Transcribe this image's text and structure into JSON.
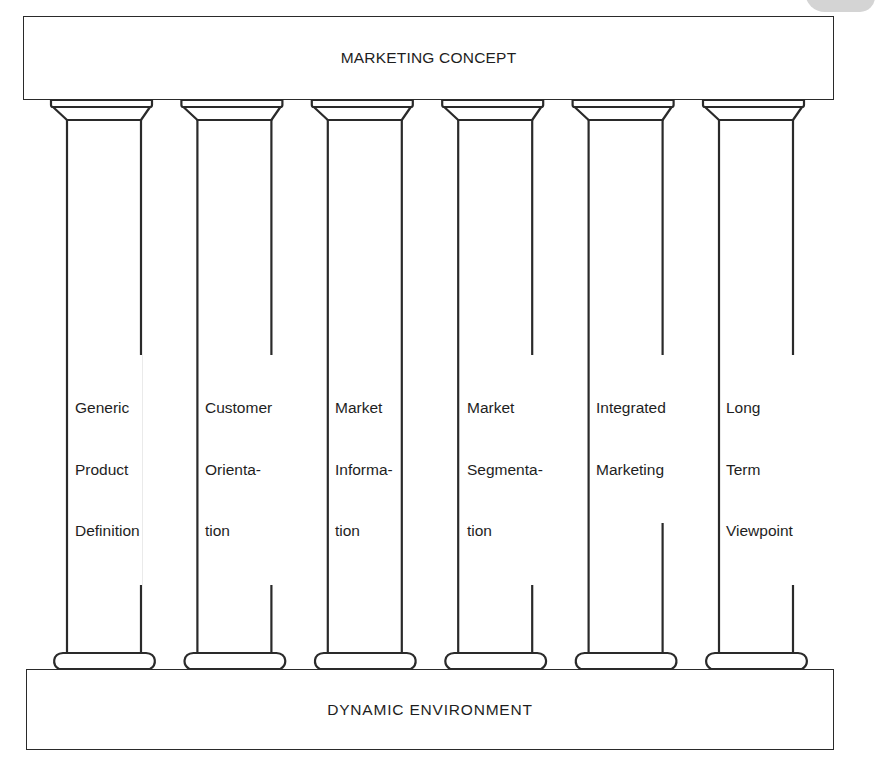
{
  "diagram": {
    "title_top": "MARKETING CONCEPT",
    "title_bottom": "DYNAMIC ENVIRONMENT",
    "stroke_color": "#2a2a2a",
    "background_color": "#ffffff",
    "pillars": [
      {
        "label_lines": [
          "Generic",
          "Product",
          "Definition"
        ],
        "label": "Generic Product Definition"
      },
      {
        "label_lines": [
          "Customer",
          "Orienta-",
          "tion"
        ],
        "label": "Customer Orientation"
      },
      {
        "label_lines": [
          "Market",
          "Informa-",
          "tion"
        ],
        "label": "Market Information"
      },
      {
        "label_lines": [
          "Market",
          "Segmenta-",
          "tion"
        ],
        "label": "Market Segmentation"
      },
      {
        "label_lines": [
          "Integrated",
          "Marketing"
        ],
        "label": "Integrated Marketing"
      },
      {
        "label_lines": [
          "Long",
          "Term",
          "Viewpoint"
        ],
        "label": "Long Term Viewpoint"
      }
    ]
  }
}
